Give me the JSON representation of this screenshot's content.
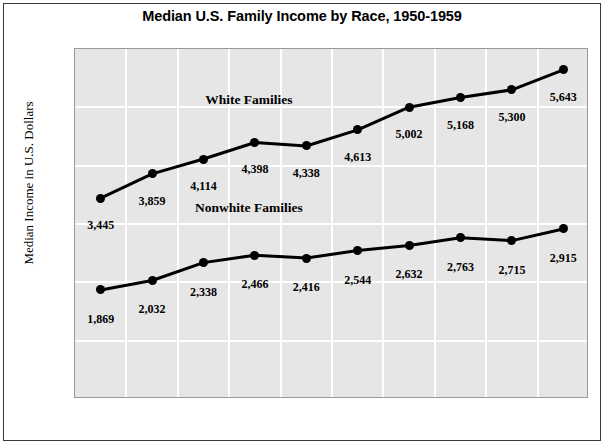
{
  "chart_data": {
    "type": "line",
    "title": "Median U.S. Family Income by Race, 1950-1959",
    "xlabel": "",
    "ylabel": "Median Income in U.S. Dollars",
    "categories": [
      "1950",
      "1951",
      "1952",
      "1953",
      "1954",
      "1955",
      "1956",
      "1957",
      "1958",
      "1959"
    ],
    "ylim": [
      0,
      6000
    ],
    "yticks": [
      "0",
      "1,000",
      "2,000",
      "3,000",
      "4,000",
      "5,000",
      "6,000"
    ],
    "ytick_values": [
      0,
      1000,
      2000,
      3000,
      4000,
      5000,
      6000
    ],
    "grid": true,
    "legend_position": "inline-annotations",
    "series": [
      {
        "name": "White Families",
        "values": [
          3445,
          3859,
          4114,
          4398,
          4338,
          4613,
          5002,
          5168,
          5300,
          5643
        ],
        "labels": [
          "3,445",
          "3,859",
          "4,114",
          "4,398",
          "4,338",
          "4,613",
          "5,002",
          "5,168",
          "5,300",
          "5,643"
        ],
        "annotation": "White Families",
        "color": "#000000"
      },
      {
        "name": "Nonwhite Families",
        "values": [
          1869,
          2032,
          2338,
          2466,
          2416,
          2544,
          2632,
          2763,
          2715,
          2915
        ],
        "labels": [
          "1,869",
          "2,032",
          "2,338",
          "2,466",
          "2,416",
          "2,544",
          "2,632",
          "2,763",
          "2,715",
          "2,915"
        ],
        "annotation": "Nonwhite Families",
        "color": "#000000"
      }
    ],
    "plot_background": "#e6e6e6",
    "gridline_color": "#ffffff",
    "frame_color": "#3a3a3a"
  }
}
